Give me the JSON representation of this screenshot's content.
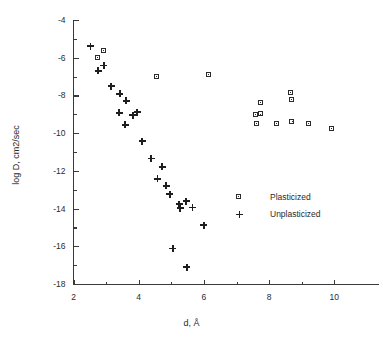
{
  "chart_data": {
    "type": "scatter",
    "title": "",
    "xlabel": "d, Å",
    "ylabel": "log D, cm2/sec",
    "xlim": [
      2,
      11.2
    ],
    "ylim": [
      -18,
      -4
    ],
    "xticks": [
      2,
      4,
      6,
      8,
      10
    ],
    "xticklabels": [
      "2",
      "4",
      "6",
      "8",
      "10"
    ],
    "xminor": [
      3,
      5,
      7,
      9
    ],
    "yticks": [
      -4,
      -6,
      -8,
      -10,
      -12,
      -14,
      -16,
      -18
    ],
    "yticklabels": [
      "-4",
      "-6",
      "-8",
      "-10",
      "-12",
      "-14",
      "-16",
      "-18"
    ],
    "yminor": [
      -5,
      -7,
      -9,
      -11,
      -13,
      -15,
      -17
    ],
    "grid": false,
    "legend_position": "center-right",
    "series": [
      {
        "name": "Plasticized",
        "marker": "square",
        "points": [
          [
            2.72,
            -5.96
          ],
          [
            2.93,
            -5.62
          ],
          [
            4.55,
            -6.97
          ],
          [
            6.13,
            -6.88
          ],
          [
            7.58,
            -9.0
          ],
          [
            7.73,
            -8.98
          ],
          [
            7.73,
            -8.35
          ],
          [
            7.6,
            -9.48
          ],
          [
            8.22,
            -9.48
          ],
          [
            8.65,
            -7.85
          ],
          [
            8.68,
            -8.2
          ],
          [
            8.7,
            -9.38
          ],
          [
            9.2,
            -9.48
          ],
          [
            9.92,
            -9.75
          ]
        ]
      },
      {
        "name": "Unplasticized",
        "marker": "plus",
        "points": [
          [
            2.52,
            -5.38
          ],
          [
            2.75,
            -6.7
          ],
          [
            2.93,
            -6.42
          ],
          [
            3.15,
            -7.52
          ],
          [
            3.42,
            -7.92
          ],
          [
            3.4,
            -8.92
          ],
          [
            3.62,
            -8.28
          ],
          [
            3.58,
            -9.55
          ],
          [
            3.82,
            -9.05
          ],
          [
            3.95,
            -8.88
          ],
          [
            4.1,
            -10.42
          ],
          [
            4.38,
            -11.35
          ],
          [
            4.72,
            -11.78
          ],
          [
            4.58,
            -12.42
          ],
          [
            4.85,
            -12.8
          ],
          [
            4.95,
            -13.25
          ],
          [
            5.25,
            -13.78
          ],
          [
            5.28,
            -13.98
          ],
          [
            5.45,
            -13.6
          ],
          [
            5.65,
            -13.95
          ],
          [
            6.0,
            -14.88
          ],
          [
            5.05,
            -16.12
          ],
          [
            5.48,
            -17.1
          ]
        ]
      }
    ]
  },
  "legend": {
    "entries": [
      {
        "label": "Plasticized",
        "marker": "square"
      },
      {
        "label": "Unplasticized",
        "marker": "plus"
      }
    ]
  }
}
